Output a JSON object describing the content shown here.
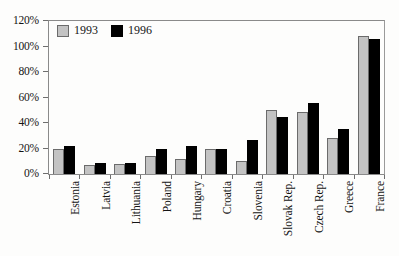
{
  "chart_data": {
    "type": "bar",
    "title": "",
    "xlabel": "",
    "ylabel": "",
    "ylim": [
      0,
      120
    ],
    "ytick_labels": [
      "0%",
      "20%",
      "40%",
      "60%",
      "80%",
      "100%",
      "120%"
    ],
    "ytick_values": [
      0,
      20,
      40,
      60,
      80,
      100,
      120
    ],
    "grid": false,
    "legend_position": "top-left",
    "categories": [
      "Estonia",
      "Latvia",
      "Lithuania",
      "Poland",
      "Hungary",
      "Croatia",
      "Slovenia",
      "Slovak Rep.",
      "Czech Rep.",
      "Greece",
      "France"
    ],
    "series": [
      {
        "name": "1993",
        "color": "#c3c3c3",
        "values": [
          20,
          7,
          8,
          14,
          12,
          20,
          10,
          50,
          49,
          28,
          108
        ]
      },
      {
        "name": "1996",
        "color": "#000000",
        "values": [
          22,
          9,
          9,
          20,
          22,
          20,
          27,
          45,
          56,
          35,
          106
        ]
      }
    ]
  },
  "legend": {
    "items": [
      {
        "label": "1993",
        "swatch": "light-gray-square"
      },
      {
        "label": "1996",
        "swatch": "black-square"
      }
    ]
  }
}
